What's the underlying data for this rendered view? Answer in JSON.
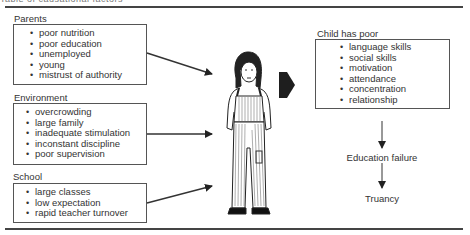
{
  "caption": "Table of causational factors",
  "groups": [
    {
      "label": "Parents",
      "items": [
        "poor nutrition",
        "poor education",
        "unemployed",
        "young",
        "mistrust of authority"
      ]
    },
    {
      "label": "Environment",
      "items": [
        "overcrowding",
        "large family",
        "inadequate stimulation",
        "inconstant discipline",
        "poor supervision"
      ]
    },
    {
      "label": "School",
      "items": [
        "large classes",
        "low expectation",
        "rapid teacher turnover"
      ]
    }
  ],
  "outcome": {
    "label": "Child has poor",
    "items": [
      "language skills",
      "social skills",
      "motivation",
      "attendance",
      "concentration",
      "relationship"
    ]
  },
  "flow": [
    "Education failure",
    "Truancy"
  ],
  "figure": "child-illustration",
  "colors": {
    "ink": "#2a2a2a",
    "background": "#ffffff"
  }
}
